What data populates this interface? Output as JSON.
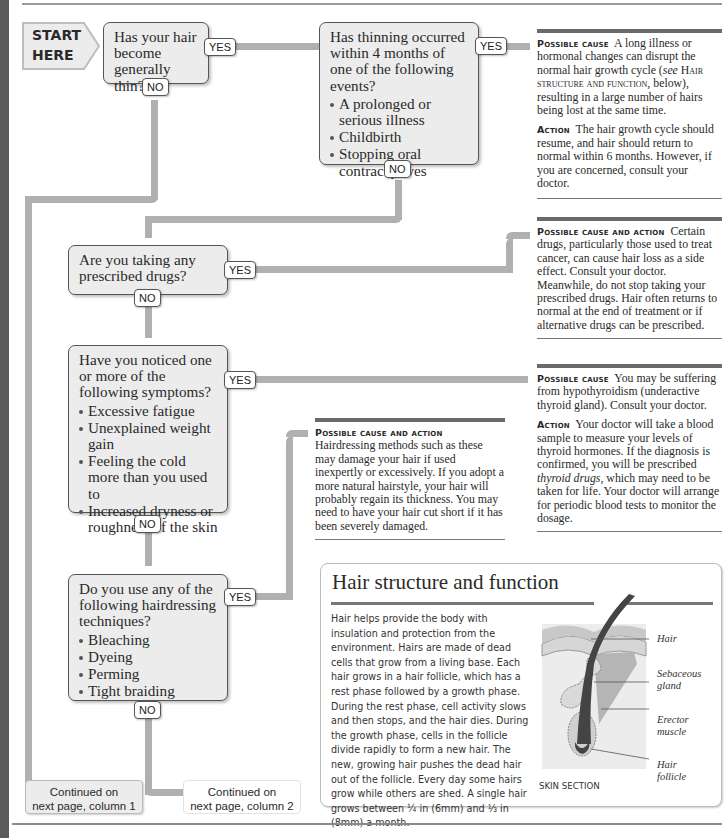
{
  "start": {
    "line1": "START",
    "line2": "HERE"
  },
  "tags": {
    "yes": "YES",
    "no": "NO"
  },
  "questions": [
    {
      "text": "Has your hair become generally thin?",
      "bullets": []
    },
    {
      "text": "Has thinning occurred within 4 months of one of the following events?",
      "bullets": [
        "A prolonged or serious illness",
        "Childbirth",
        "Stopping oral contraceptives"
      ]
    },
    {
      "text": "Are you taking any prescribed drugs?",
      "bullets": []
    },
    {
      "text": "Have you noticed one or more of the following symptoms?",
      "bullets": [
        "Excessive fatigue",
        "Unexplained weight gain",
        "Feeling the cold more than you used to",
        "Increased dryness or roughness of the skin"
      ]
    },
    {
      "text": "Do you use any of the following hairdressing techniques?",
      "bullets": [
        "Bleaching",
        "Dyeing",
        "Perming",
        "Tight braiding"
      ]
    }
  ],
  "outcomes": [
    {
      "cause_label": "Possible cause",
      "cause_text_a": "A long illness or hormonal changes can disrupt the normal hair growth cycle (",
      "cause_see": "see",
      "cause_ref": "Hair structure and function",
      "cause_text_b": ", below), resulting in a large number of hairs being lost at the same time.",
      "action_label": "Action",
      "action_text": "The hair growth cycle should resume, and hair should return to normal within 6 months. However, if you are concerned, consult your doctor."
    },
    {
      "cause_label": "Possible cause and action",
      "cause_text": "Certain drugs, particularly those used to treat cancer, can cause hair loss as a side effect. Consult your doctor. Meanwhile, do not stop taking your prescribed drugs. Hair often returns to normal at the end of treatment or if alternative drugs can be prescribed."
    },
    {
      "cause_label": "Possible cause",
      "cause_text": "You may be suffering from hypothyroidism (underactive thyroid gland). Consult your doctor.",
      "action_label": "Action",
      "action_text_a": "Your doctor will take a blood sample to measure your levels of thyroid hormones. If the diagnosis is confirmed, you will be prescribed ",
      "action_italic": "thyroid drugs",
      "action_text_b": ", which may need to be taken for life. Your doctor will arrange for periodic blood tests to monitor the dosage."
    },
    {
      "cause_label": "Possible cause and action",
      "cause_text": "Hairdressing methods such as these may damage your hair if used inexpertly or excessively. If you adopt a more natural hairstyle, your hair will probably regain its thickness. You may need to have your hair cut short if it has been severely damaged."
    }
  ],
  "continued": [
    {
      "line1": "Continued on",
      "line2": "next page, column 1"
    },
    {
      "line1": "Continued on",
      "line2": "next page, column 2"
    }
  ],
  "infobox": {
    "title": "Hair structure and function",
    "body": "Hair helps provide the body with insulation and protection from the environment. Hairs are made of dead cells that grow from a living base. Each hair grows in a hair follicle, which has a rest phase followed by a growth phase. During the rest phase, cell activity slows and then stops, and the hair dies. During the growth phase, cells in the follicle divide rapidly to form a new hair. The new, growing hair pushes the dead hair out of the follicle. Every day some hairs grow while others are shed. A single hair grows between ¼ in (6mm) and ⅓ in (8mm) a month.",
    "diagram_labels": [
      "Hair",
      "Sebaceous gland",
      "Erector muscle",
      "Hair follicle"
    ],
    "caption": "SKIN SECTION"
  },
  "colors": {
    "path": "#b0b0b0",
    "box_fill": "#ececec",
    "strip": "#5a5a5a",
    "rule": "#6a6a6a"
  }
}
